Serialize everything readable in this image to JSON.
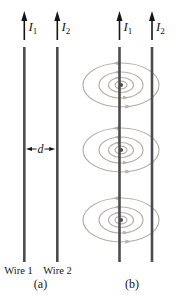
{
  "colors": {
    "wire": "#4d4d4d",
    "field": "#b6b3ab",
    "ink": "#161616",
    "bg": "#ffffff"
  },
  "panel_a": {
    "caption": "(a)",
    "current1": {
      "base": "I",
      "sub": "1"
    },
    "current2": {
      "base": "I",
      "sub": "2"
    },
    "distance": "d",
    "wire1": "Wire 1",
    "wire2": "Wire 2"
  },
  "panel_b": {
    "caption": "(b)",
    "current1": {
      "base": "I",
      "sub": "1"
    },
    "current2": {
      "base": "I",
      "sub": "2"
    }
  }
}
